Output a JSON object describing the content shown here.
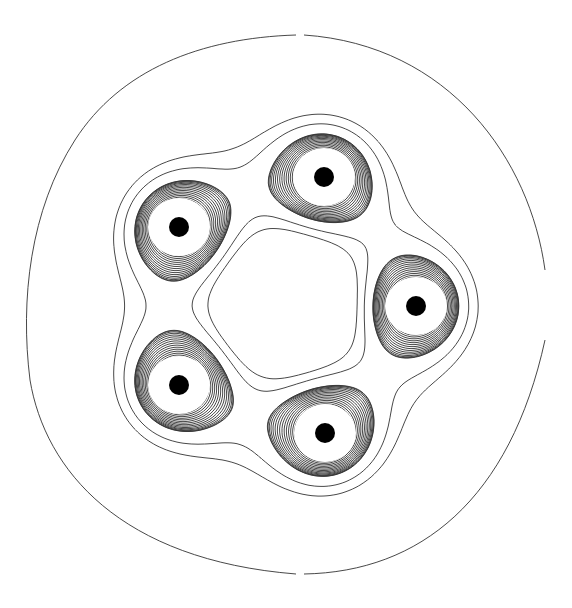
{
  "figure": {
    "title": "Contour plot of a five-center ring (pentagonal arrangement)",
    "width": 572,
    "height": 608,
    "background": "#ffffff",
    "line_color": "#333333",
    "nucleus_color": "#000000"
  },
  "centers": [
    {
      "name": "nucleus-top",
      "x": 324,
      "y": 177
    },
    {
      "name": "nucleus-upper-left",
      "x": 179,
      "y": 227
    },
    {
      "name": "nucleus-right",
      "x": 416,
      "y": 306
    },
    {
      "name": "nucleus-lower-left",
      "x": 179,
      "y": 385
    },
    {
      "name": "nucleus-bottom",
      "x": 325,
      "y": 433
    }
  ],
  "ring_center": {
    "x": 287,
    "y": 303
  },
  "nucleus_radius": 10,
  "outer_contour": {
    "gaps": [
      {
        "position": "top",
        "x": 299,
        "y": 35
      },
      {
        "position": "bottom",
        "x": 299,
        "y": 574
      },
      {
        "position": "right",
        "x": 545,
        "y": 305
      }
    ]
  }
}
